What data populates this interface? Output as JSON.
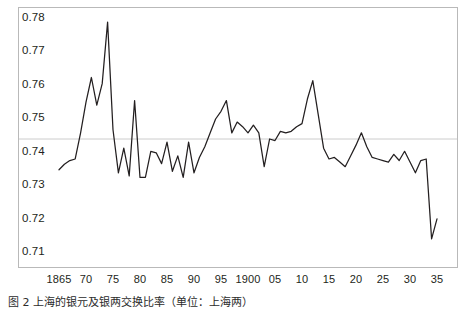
{
  "figure": {
    "caption": "图 2  上海的银元及银两交换比率（单位：上海两）",
    "frame_color": "#b9b9b9",
    "line_color": "#231f20",
    "gridline_color": "#cccccc"
  },
  "chart_data": {
    "type": "line",
    "title": "",
    "subtitle": "",
    "xlabel": "",
    "ylabel": "",
    "xlim": [
      1865,
      1935
    ],
    "ylim": [
      0.705,
      0.7825
    ],
    "grid": "single horizontal gridline at y=0.74",
    "legend": "none",
    "y_ticks": [
      "0.71",
      "0.72",
      "0.73",
      "0.74",
      "0.75",
      "0.76",
      "0.77",
      "0.78"
    ],
    "y_tick_values": [
      0.71,
      0.72,
      0.73,
      0.74,
      0.75,
      0.76,
      0.77,
      0.78
    ],
    "x_ticks": [
      "1865",
      "70",
      "75",
      "80",
      "85",
      "90",
      "95",
      "1900",
      "05",
      "10",
      "15",
      "20",
      "25",
      "30",
      "35"
    ],
    "x_tick_values": [
      1865,
      1870,
      1875,
      1880,
      1885,
      1890,
      1895,
      1900,
      1905,
      1910,
      1915,
      1920,
      1925,
      1930,
      1935
    ],
    "series": [
      {
        "name": "上海银元银两交换比率",
        "x": [
          1865,
          1866,
          1867,
          1868,
          1869,
          1870,
          1871,
          1872,
          1873,
          1874,
          1875,
          1876,
          1877,
          1878,
          1879,
          1880,
          1881,
          1882,
          1883,
          1884,
          1885,
          1886,
          1887,
          1888,
          1889,
          1890,
          1891,
          1892,
          1893,
          1894,
          1895,
          1896,
          1897,
          1898,
          1899,
          1900,
          1901,
          1902,
          1903,
          1904,
          1905,
          1906,
          1907,
          1908,
          1909,
          1910,
          1911,
          1912,
          1913,
          1914,
          1915,
          1916,
          1917,
          1918,
          1919,
          1920,
          1921,
          1922,
          1923,
          1924,
          1925,
          1926,
          1927,
          1928,
          1929,
          1930,
          1931,
          1932,
          1933,
          1934,
          1935
        ],
        "values": [
          0.73,
          0.7318,
          0.733,
          0.7335,
          0.742,
          0.752,
          0.76,
          0.751,
          0.758,
          0.778,
          0.743,
          0.729,
          0.737,
          0.728,
          0.7525,
          0.7275,
          0.7275,
          0.736,
          0.7355,
          0.732,
          0.739,
          0.7295,
          0.7345,
          0.7275,
          0.739,
          0.729,
          0.734,
          0.7375,
          0.742,
          0.7465,
          0.749,
          0.7525,
          0.742,
          0.7455,
          0.744,
          0.742,
          0.7445,
          0.742,
          0.731,
          0.74,
          0.7395,
          0.7425,
          0.742,
          0.7425,
          0.744,
          0.745,
          0.753,
          0.759,
          0.748,
          0.737,
          0.7335,
          0.734,
          0.7325,
          0.731,
          0.7345,
          0.738,
          0.742,
          0.7375,
          0.734,
          0.7335,
          0.733,
          0.7325,
          0.735,
          0.733,
          0.736,
          0.7325,
          0.729,
          0.733,
          0.7335,
          0.7075,
          0.714
        ]
      }
    ]
  }
}
